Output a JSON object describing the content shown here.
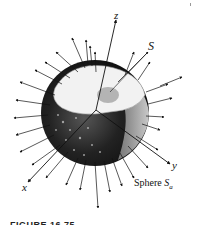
{
  "figure": {
    "axes": {
      "x_label": "x",
      "y_label": "y",
      "z_label": "z"
    },
    "surface_label": "S",
    "sphere_label_prefix": "Sphere ",
    "sphere_label_symbol": "S",
    "sphere_label_subscript": "a",
    "caption": "FIGURE 16.75",
    "colors": {
      "ink": "#111111",
      "sphere_dark": "#1a1a1a",
      "sphere_mid": "#6b6b6b",
      "cut_face": "#f2f2f2",
      "background": "#ffffff"
    }
  }
}
